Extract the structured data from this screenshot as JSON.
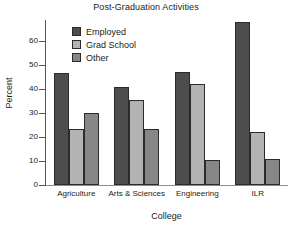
{
  "chart_data": {
    "type": "bar",
    "title": "Post-Graduation Activities",
    "xlabel": "College",
    "ylabel": "Percent",
    "categories": [
      "Agriculture",
      "Arts & Sciences",
      "Engineering",
      "ILR"
    ],
    "series": [
      {
        "name": "Employed",
        "color": "#4d4d4d",
        "values": [
          46.5,
          41.0,
          47.0,
          68.0
        ]
      },
      {
        "name": "Grad School",
        "color": "#b3b3b3",
        "values": [
          23.5,
          35.5,
          42.0,
          22.0
        ]
      },
      {
        "name": "Other",
        "color": "#878787",
        "values": [
          30.0,
          23.5,
          10.5,
          11.0
        ]
      }
    ],
    "ylim": [
      0,
      70
    ],
    "yticks": [
      0,
      10,
      20,
      30,
      40,
      50,
      60
    ],
    "ytick_labels": [
      "0",
      "10",
      "20",
      "30",
      "40",
      "50",
      "60"
    ],
    "grid": false,
    "legend_position": "upper-left-inside",
    "axis_color": "#555555",
    "bar_outline_color": "#2b2b2b",
    "background_color": "#ffffff"
  }
}
